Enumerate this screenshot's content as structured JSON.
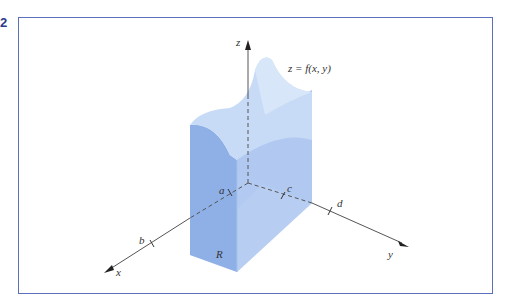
{
  "figure": {
    "number": "2",
    "frame_color": "#5b6fbd",
    "surface_label": "z = f(x, y)",
    "axes": {
      "x": "x",
      "y": "y",
      "z": "z"
    },
    "tick_labels": {
      "a": "a",
      "b": "b",
      "c": "c",
      "d": "d"
    },
    "region_label": "R",
    "colors": {
      "side_dark": "#8fb0e6",
      "side_mid": "#a9c3ee",
      "top": "#c7dbf6",
      "bottom": "#dce8fa",
      "axis": "#333333"
    }
  }
}
